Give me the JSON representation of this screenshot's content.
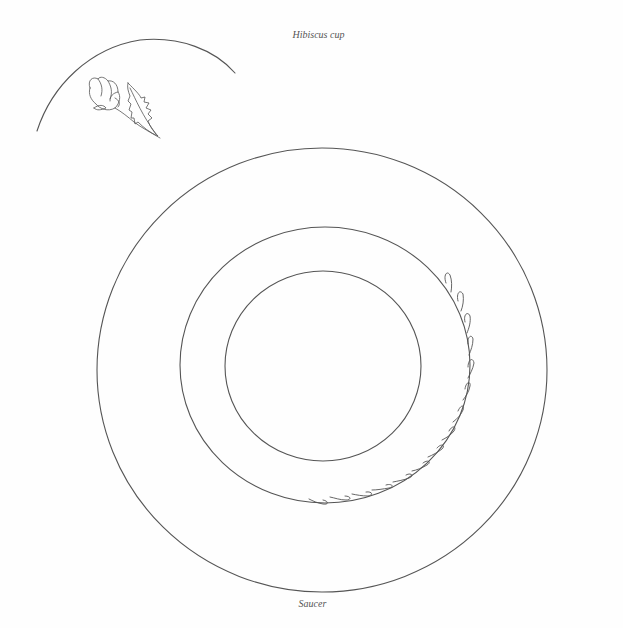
{
  "diagram": {
    "title": "Hibiscus cup",
    "caption": "Saucer",
    "stroke_color": "#555555",
    "background": "#fefefe",
    "cup_sketch": {
      "shape": "partial rim arc",
      "motif": "hibiscus bud with serrated leaf"
    },
    "saucer": {
      "rings": [
        {
          "name": "outer-rim",
          "cx": 322,
          "cy": 370,
          "rx": 225,
          "ry": 222
        },
        {
          "name": "middle-well",
          "cx": 325,
          "cy": 365,
          "rx": 145,
          "ry": 138
        },
        {
          "name": "inner-center",
          "cx": 323,
          "cy": 366,
          "rx": 98,
          "ry": 95
        }
      ],
      "decoration": "teardrop leaf border along lower-right of middle ring"
    }
  }
}
